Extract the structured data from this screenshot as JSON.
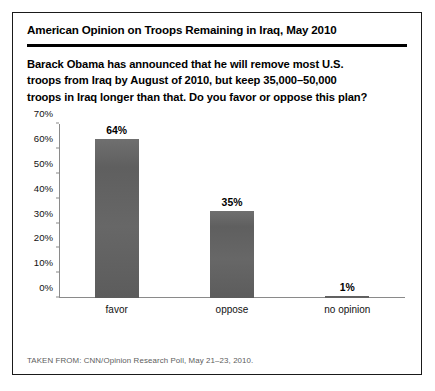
{
  "figure": {
    "title": "American Opinion on Troops Remaining in Iraq, May 2010",
    "subtitle_lines": [
      "Barack Obama has announced that he will remove most U.S.",
      "troops from Iraq by August of 2010, but keep 35,000–50,000",
      "troops in Iraq longer than that. Do you favor or oppose this plan?"
    ],
    "source": "TAKEN FROM: CNN/Opinion Research Poll, May 21–23, 2010."
  },
  "colors": {
    "bar": "#636363",
    "axis": "#8a8a8a",
    "frame": "#1a1a1a",
    "text": "#000000",
    "source_text": "#5d5d5d"
  },
  "chart_data": {
    "type": "bar",
    "title": "American Opinion on Troops Remaining in Iraq, May 2010",
    "subtitle": "Barack Obama has announced that he will remove most U.S. troops from Iraq by August of 2010, but keep 35,000–50,000 troops in Iraq longer than that. Do you favor or oppose this plan?",
    "categories": [
      "favor",
      "oppose",
      "no opinion"
    ],
    "values": [
      64,
      35,
      1
    ],
    "value_labels": [
      "64%",
      "35%",
      "1%"
    ],
    "xlabel": "",
    "ylabel": "",
    "ylim": [
      0,
      70
    ],
    "ytick_values": [
      0,
      10,
      20,
      30,
      40,
      50,
      60,
      70
    ],
    "ytick_labels": [
      "0%",
      "10%",
      "20%",
      "30%",
      "40%",
      "50%",
      "60%",
      "70%"
    ],
    "grid": false,
    "legend": false,
    "units": "percent",
    "source": "CNN/Opinion Research Poll, May 21–23, 2010."
  }
}
